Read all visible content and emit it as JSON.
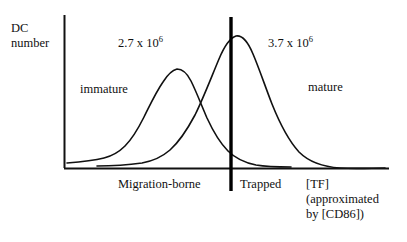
{
  "figure": {
    "axes": {
      "y_axis_label": "DC\nnumber",
      "x_axis_label": "[TF]\n(approximated\nby [CD86])"
    },
    "annotations": {
      "left_peak_count_mantissa": "2.7 x 10",
      "left_peak_count_exponent": "6",
      "right_peak_count_mantissa": "3.7 x 10",
      "right_peak_count_exponent": "6",
      "left_curve_label": "immature",
      "right_curve_label": "mature"
    },
    "regions": {
      "left_region_label": "Migration-borne",
      "right_region_label": "Trapped"
    },
    "colors": {
      "ink": "#111111",
      "background": "#ffffff",
      "divider": "#000000"
    }
  },
  "chart_data": {
    "type": "line",
    "title": "",
    "xlabel": "[TF] (approximated by [CD86])",
    "ylabel": "DC number",
    "grid": false,
    "legend": "inline-annotations",
    "xlim": [
      0,
      1
    ],
    "ylim": [
      0,
      1
    ],
    "divider": {
      "label": "Trapped threshold",
      "x": 0.512,
      "style": "thick vertical line"
    },
    "series": [
      {
        "name": "immature",
        "total_count": "2.7 x 10^6",
        "peak_x": 0.342,
        "peak_y": 0.607,
        "x": [
          0.0,
          0.05,
          0.1,
          0.14,
          0.18,
          0.22,
          0.26,
          0.3,
          0.34,
          0.38,
          0.42,
          0.46,
          0.5,
          0.55,
          0.6,
          0.65,
          0.7,
          0.76,
          0.82,
          0.88,
          0.94,
          1.0
        ],
        "y": [
          0.03,
          0.04,
          0.06,
          0.09,
          0.15,
          0.26,
          0.41,
          0.55,
          0.61,
          0.59,
          0.51,
          0.39,
          0.28,
          0.18,
          0.12,
          0.08,
          0.06,
          0.04,
          0.03,
          0.02,
          0.02,
          0.02
        ]
      },
      {
        "name": "mature",
        "total_count": "3.7 x 10^6",
        "peak_x": 0.527,
        "peak_y": 0.872,
        "x": [
          0.0,
          0.06,
          0.12,
          0.18,
          0.24,
          0.3,
          0.36,
          0.42,
          0.47,
          0.53,
          0.58,
          0.63,
          0.68,
          0.73,
          0.78,
          0.83,
          0.88,
          0.93,
          1.0
        ],
        "y": [
          0.01,
          0.02,
          0.03,
          0.05,
          0.09,
          0.17,
          0.3,
          0.52,
          0.72,
          0.87,
          0.86,
          0.75,
          0.59,
          0.42,
          0.28,
          0.17,
          0.1,
          0.06,
          0.03
        ]
      }
    ]
  }
}
